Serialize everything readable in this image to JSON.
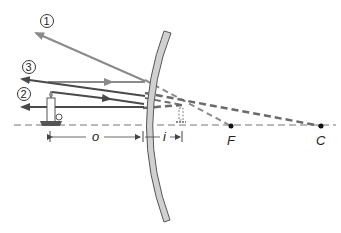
{
  "diagram": {
    "type": "convex-mirror-ray-diagram",
    "ray_labels": [
      "1",
      "2",
      "3"
    ],
    "distance_labels": {
      "object": "o",
      "image": "i"
    },
    "point_labels": {
      "focal": "F",
      "center": "C"
    },
    "colors": {
      "mirror_fill": "#d0d0d0",
      "mirror_stroke": "#555555",
      "ray_gray": "#8a8a8a",
      "ray_dark": "#4a4a4a",
      "axis": "#777777",
      "points": "#111111"
    }
  }
}
